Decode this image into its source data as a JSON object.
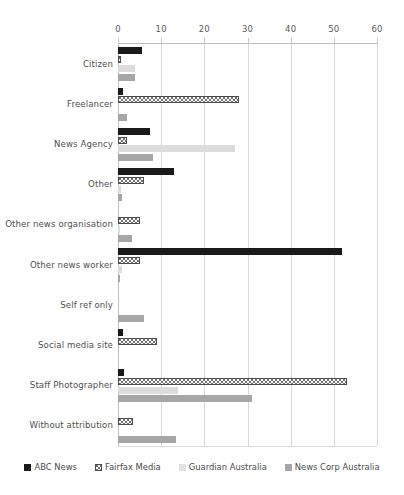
{
  "chart_data": {
    "type": "bar",
    "orientation": "horizontal",
    "title": "",
    "xlabel": "",
    "ylabel": "",
    "xlim": [
      0,
      60
    ],
    "xticks": [
      0,
      10,
      20,
      30,
      40,
      50,
      60
    ],
    "grid": true,
    "legend_position": "bottom",
    "categories": [
      "Citizen",
      "Freelancer",
      "News Agency",
      "Other",
      "Other news organisation",
      "Other news worker",
      "Self ref only",
      "Social media site",
      "Staff Photographer",
      "Without attribution"
    ],
    "series": [
      {
        "name": "ABC News",
        "color": "#1a1a1a",
        "pattern": "solid",
        "values": [
          5.5,
          1.2,
          7.5,
          13,
          0,
          52,
          0,
          1.2,
          1.3,
          0
        ]
      },
      {
        "name": "Fairfax Media",
        "color": "#ffffff",
        "pattern": "dotted",
        "values": [
          0.6,
          28,
          2.2,
          6,
          5,
          5,
          0,
          9,
          53,
          3.5
        ]
      },
      {
        "name": "Guardian Australia",
        "color": "#dcdcdc",
        "pattern": "solid",
        "values": [
          4,
          0,
          27,
          0.6,
          0.5,
          1,
          0,
          0,
          14,
          0
        ]
      },
      {
        "name": "News Corp Australia",
        "color": "#a6a6a6",
        "pattern": "solid",
        "values": [
          4,
          2,
          8,
          1,
          3.2,
          0.5,
          6,
          0,
          31,
          13.5
        ]
      }
    ]
  },
  "legend": {
    "items": [
      {
        "label": "ABC News"
      },
      {
        "label": "Fairfax Media"
      },
      {
        "label": "Guardian Australia"
      },
      {
        "label": "News Corp Australia"
      }
    ]
  }
}
